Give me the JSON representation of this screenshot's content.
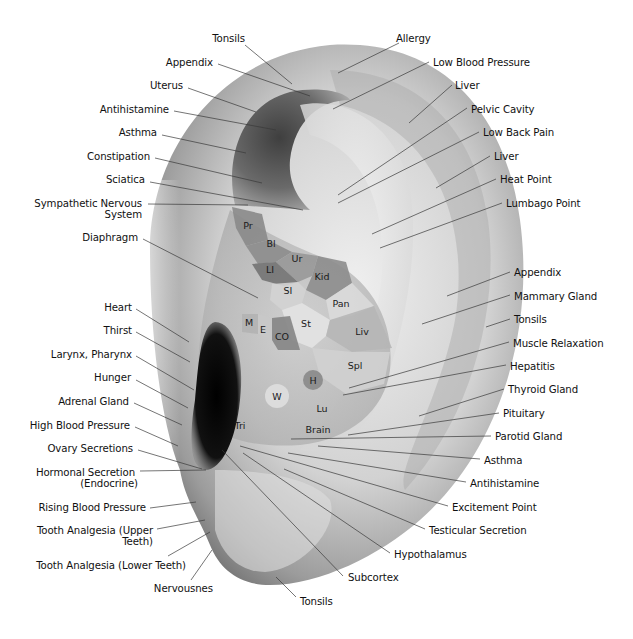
{
  "diagram": {
    "title": "Ear Acupressure Points",
    "colors": {
      "background": "#ffffff",
      "ear_light": "#ececec",
      "ear_mid": "#bdbdbd",
      "ear_dark": "#7d7d7d",
      "canal": "#0d0d0d",
      "fossa": "#5a5a5a",
      "text": "#111111",
      "leader": "#3a3a3a"
    },
    "zones": [
      {
        "abbr": "Pr",
        "label_x": 248,
        "label_y": 229,
        "fill": "#8a8a8a",
        "points": "232,207 262,214 268,240 246,246 236,228"
      },
      {
        "abbr": "Bl",
        "label_x": 271,
        "label_y": 247,
        "fill": "#8c8c8c",
        "points": "246,246 268,240 292,252 276,262 258,264"
      },
      {
        "abbr": "Ur",
        "label_x": 297,
        "label_y": 262,
        "fill": "#989898",
        "points": "276,262 292,252 318,256 312,276 298,282"
      },
      {
        "abbr": "LI",
        "label_x": 270,
        "label_y": 273,
        "fill": "#737373",
        "points": "252,264 276,262 298,282 284,286 262,280"
      },
      {
        "abbr": "Kid",
        "label_x": 322,
        "label_y": 280,
        "fill": "#8d8d8d",
        "points": "312,276 318,256 346,262 352,283 326,300 306,290"
      },
      {
        "abbr": "SI",
        "label_x": 288,
        "label_y": 294,
        "fill": "#d3d3d3",
        "points": "272,284 298,282 306,290 302,303 282,310 270,300"
      },
      {
        "abbr": "Pan",
        "label_x": 341,
        "label_y": 307,
        "fill": "#dadada",
        "points": "326,300 352,283 374,306 352,316 330,320"
      },
      {
        "abbr": "St",
        "label_x": 306,
        "label_y": 327,
        "fill": "#e3e3e3",
        "points": "282,310 302,303 330,320 326,336 312,348 292,340"
      },
      {
        "abbr": "M",
        "label_x": 249,
        "label_y": 326,
        "fill": "#b3b3b3",
        "points": "242,314 258,314 258,334 242,332"
      },
      {
        "abbr": "E",
        "label_x": 263,
        "label_y": 333,
        "fill": "#c8c8c8",
        "points": "258,314 272,318 272,340 258,334"
      },
      {
        "abbr": "CO",
        "label_x": 282,
        "label_y": 340,
        "fill": "#858585",
        "points": "272,318 290,316 300,350 278,350 272,340"
      },
      {
        "abbr": "Liv",
        "label_x": 362,
        "label_y": 335,
        "fill": "#b6b6b6",
        "points": "330,320 374,306 392,348 352,352 326,336"
      },
      {
        "abbr": "Spl",
        "label_x": 355,
        "label_y": 369,
        "fill": "#d0d0d0",
        "points": "312,348 352,352 390,352 384,384 346,394 320,376"
      }
    ],
    "circles": [
      {
        "abbr": "H",
        "cx": 313,
        "cy": 380,
        "r": 10,
        "fill": "#8f8f8f"
      },
      {
        "abbr": "W",
        "cx": 277,
        "cy": 396,
        "r": 12,
        "fill": "#dcdcdc"
      }
    ],
    "plain_zone_labels": [
      {
        "abbr": "Lu",
        "x": 322,
        "y": 412
      },
      {
        "abbr": "Brain",
        "x": 318,
        "y": 433
      },
      {
        "abbr": "Tri",
        "x": 240,
        "y": 429
      }
    ],
    "left_labels": [
      {
        "text": "Tonsils",
        "x": 245,
        "y": 42,
        "anchor": "end",
        "lx1": 245,
        "ly1": 45,
        "lx2": 292,
        "ly2": 84
      },
      {
        "text": "Appendix",
        "x": 213,
        "y": 66,
        "anchor": "end",
        "lx1": 218,
        "ly1": 64,
        "lx2": 310,
        "ly2": 96
      },
      {
        "text": "Uterus",
        "x": 183,
        "y": 89,
        "anchor": "end",
        "lx1": 188,
        "ly1": 88,
        "lx2": 256,
        "ly2": 112
      },
      {
        "text": "Antihistamine",
        "x": 169,
        "y": 113,
        "anchor": "end",
        "lx1": 174,
        "ly1": 111,
        "lx2": 276,
        "ly2": 130
      },
      {
        "text": "Asthma",
        "x": 157,
        "y": 136,
        "anchor": "end",
        "lx1": 162,
        "ly1": 135,
        "lx2": 246,
        "ly2": 153
      },
      {
        "text": "Constipation",
        "x": 150,
        "y": 160,
        "anchor": "end",
        "lx1": 155,
        "ly1": 158,
        "lx2": 262,
        "ly2": 183
      },
      {
        "text": "Sciatica",
        "x": 145,
        "y": 183,
        "anchor": "end",
        "lx1": 150,
        "ly1": 182,
        "lx2": 303,
        "ly2": 210
      },
      {
        "text": "Sympathetic Nervous",
        "x": 142,
        "y": 207,
        "anchor": "end",
        "lx1": 148,
        "ly1": 204,
        "lx2": 248,
        "ly2": 205
      },
      {
        "text": "System",
        "x": 142,
        "y": 218,
        "anchor": "end"
      },
      {
        "text": "Diaphragm",
        "x": 138,
        "y": 241,
        "anchor": "end",
        "lx1": 143,
        "ly1": 239,
        "lx2": 258,
        "ly2": 298
      },
      {
        "text": "Heart",
        "x": 132,
        "y": 311,
        "anchor": "end",
        "lx1": 136,
        "ly1": 309,
        "lx2": 189,
        "ly2": 342
      },
      {
        "text": "Thirst",
        "x": 132,
        "y": 334,
        "anchor": "end",
        "lx1": 136,
        "ly1": 332,
        "lx2": 190,
        "ly2": 362
      },
      {
        "text": "Larynx, Pharynx",
        "x": 132,
        "y": 358,
        "anchor": "end",
        "lx1": 136,
        "ly1": 356,
        "lx2": 194,
        "ly2": 390
      },
      {
        "text": "Hunger",
        "x": 131,
        "y": 381,
        "anchor": "end",
        "lx1": 136,
        "ly1": 380,
        "lx2": 188,
        "ly2": 408
      },
      {
        "text": "Adrenal Gland",
        "x": 129,
        "y": 405,
        "anchor": "end",
        "lx1": 134,
        "ly1": 403,
        "lx2": 182,
        "ly2": 425
      },
      {
        "text": "High Blood Pressure",
        "x": 130,
        "y": 429,
        "anchor": "end",
        "lx1": 135,
        "ly1": 427,
        "lx2": 178,
        "ly2": 446
      },
      {
        "text": "Ovary Secretions",
        "x": 133,
        "y": 452,
        "anchor": "end",
        "lx1": 138,
        "ly1": 450,
        "lx2": 202,
        "ly2": 469
      },
      {
        "text": "Hormonal Secretion",
        "x": 135,
        "y": 476,
        "anchor": "end",
        "lx1": 140,
        "ly1": 471,
        "lx2": 206,
        "ly2": 470
      },
      {
        "text": "(Endocrine)",
        "x": 138,
        "y": 487,
        "anchor": "end"
      },
      {
        "text": "Rising Blood Pressure",
        "x": 146,
        "y": 511,
        "anchor": "end",
        "lx1": 150,
        "ly1": 508,
        "lx2": 196,
        "ly2": 502
      },
      {
        "text": "Tooth Analgesia (Upper",
        "x": 153,
        "y": 534,
        "anchor": "end",
        "lx1": 157,
        "ly1": 529,
        "lx2": 205,
        "ly2": 520
      },
      {
        "text": "Teeth)",
        "x": 153,
        "y": 545,
        "anchor": "end"
      },
      {
        "text": "Tooth Analgesia (Lower Teeth)",
        "x": 186,
        "y": 569,
        "anchor": "end",
        "lx1": 168,
        "ly1": 556,
        "lx2": 210,
        "ly2": 532
      },
      {
        "text": "Nervousnes",
        "x": 213,
        "y": 592,
        "anchor": "end",
        "lx1": 191,
        "ly1": 580,
        "lx2": 212,
        "ly2": 550
      }
    ],
    "right_labels": [
      {
        "text": "Allergy",
        "x": 396,
        "y": 42,
        "lx1": 399,
        "ly1": 43,
        "lx2": 338,
        "ly2": 73
      },
      {
        "text": "Low Blood Pressure",
        "x": 433,
        "y": 66,
        "lx1": 429,
        "ly1": 62,
        "lx2": 333,
        "ly2": 109
      },
      {
        "text": "Liver",
        "x": 455,
        "y": 89,
        "lx1": 452,
        "ly1": 85,
        "lx2": 409,
        "ly2": 123
      },
      {
        "text": "Pelvic Cavity",
        "x": 471,
        "y": 113,
        "lx1": 467,
        "ly1": 108,
        "lx2": 338,
        "ly2": 195
      },
      {
        "text": "Low Back Pain",
        "x": 483,
        "y": 136,
        "lx1": 479,
        "ly1": 132,
        "lx2": 338,
        "ly2": 203
      },
      {
        "text": "Liver",
        "x": 494,
        "y": 160,
        "lx1": 490,
        "ly1": 156,
        "lx2": 436,
        "ly2": 188
      },
      {
        "text": "Heat Point",
        "x": 500,
        "y": 183,
        "lx1": 496,
        "ly1": 179,
        "lx2": 372,
        "ly2": 234
      },
      {
        "text": "Lumbago Point",
        "x": 506,
        "y": 207,
        "lx1": 502,
        "ly1": 203,
        "lx2": 380,
        "ly2": 248
      },
      {
        "text": "Appendix",
        "x": 514,
        "y": 276,
        "lx1": 510,
        "ly1": 272,
        "lx2": 447,
        "ly2": 296
      },
      {
        "text": "Mammary Gland",
        "x": 514,
        "y": 300,
        "lx1": 510,
        "ly1": 295,
        "lx2": 422,
        "ly2": 324
      },
      {
        "text": "Tonsils",
        "x": 514,
        "y": 323,
        "lx1": 510,
        "ly1": 319,
        "lx2": 486,
        "ly2": 327
      },
      {
        "text": "Muscle Relaxation",
        "x": 513,
        "y": 347,
        "lx1": 509,
        "ly1": 342,
        "lx2": 349,
        "ly2": 388
      },
      {
        "text": "Hepatitis",
        "x": 510,
        "y": 370,
        "lx1": 506,
        "ly1": 365,
        "lx2": 343,
        "ly2": 395
      },
      {
        "text": "Thyroid Gland",
        "x": 508,
        "y": 393,
        "lx1": 504,
        "ly1": 389,
        "lx2": 419,
        "ly2": 416
      },
      {
        "text": "Pituitary",
        "x": 503,
        "y": 417,
        "lx1": 499,
        "ly1": 413,
        "lx2": 348,
        "ly2": 435
      },
      {
        "text": "Parotid Gland",
        "x": 495,
        "y": 440,
        "lx1": 491,
        "ly1": 436,
        "lx2": 291,
        "ly2": 439
      },
      {
        "text": "Asthma",
        "x": 484,
        "y": 464,
        "lx1": 480,
        "ly1": 459,
        "lx2": 318,
        "ly2": 446
      },
      {
        "text": "Antihistamine",
        "x": 470,
        "y": 487,
        "lx1": 466,
        "ly1": 482,
        "lx2": 288,
        "ly2": 453
      },
      {
        "text": "Excitement Point",
        "x": 452,
        "y": 511,
        "lx1": 448,
        "ly1": 506,
        "lx2": 240,
        "ly2": 446
      },
      {
        "text": "Testicular Secretion",
        "x": 429,
        "y": 534,
        "lx1": 425,
        "ly1": 529,
        "lx2": 284,
        "ly2": 469
      },
      {
        "text": "Hypothalamus",
        "x": 394,
        "y": 558,
        "lx1": 390,
        "ly1": 553,
        "lx2": 243,
        "ly2": 453
      },
      {
        "text": "Subcortex",
        "x": 348,
        "y": 581,
        "lx1": 343,
        "ly1": 576,
        "lx2": 222,
        "ly2": 450
      },
      {
        "text": "Tonsils",
        "x": 300,
        "y": 605,
        "lx1": 296,
        "ly1": 597,
        "lx2": 276,
        "ly2": 577
      }
    ]
  }
}
